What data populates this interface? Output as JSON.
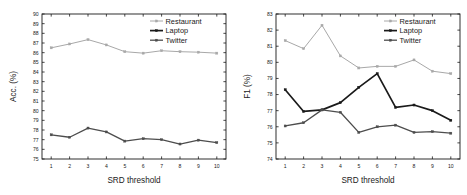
{
  "figure": {
    "background": "#ffffff",
    "panels": [
      "acc-panel",
      "f1-panel"
    ]
  },
  "legend": {
    "position": "top-right",
    "entries": [
      {
        "label": "Restaurant",
        "color": "#a8a8a8",
        "marker": "dash-square",
        "width": 1.0
      },
      {
        "label": "Laptop",
        "color": "#1a1a1a",
        "marker": "dash-square",
        "width": 1.7
      },
      {
        "label": "Twitter",
        "color": "#4d4d4d",
        "marker": "dash-square",
        "width": 1.3
      }
    ]
  },
  "chart_data": [
    {
      "type": "line",
      "name": "accuracy-chart",
      "title": "",
      "xlabel": "SRD threshold",
      "ylabel": "Acc. (%)",
      "x": [
        1,
        2,
        3,
        4,
        5,
        6,
        7,
        8,
        9,
        10
      ],
      "xticklabels": [
        "1",
        "2",
        "3",
        "4",
        "5",
        "6",
        "7",
        "8",
        "9",
        "10"
      ],
      "xlim": [
        0.5,
        10.5
      ],
      "ylim": [
        75,
        90
      ],
      "yticks": [
        75,
        76,
        77,
        78,
        79,
        80,
        81,
        82,
        83,
        84,
        85,
        86,
        87,
        88,
        89,
        90
      ],
      "yticklabels": [
        "75",
        "76",
        "77",
        "78",
        "79",
        "80",
        "81",
        "82",
        "83",
        "84",
        "85",
        "86",
        "87",
        "88",
        "89",
        "90"
      ],
      "grid": false,
      "legend_position": "top-right",
      "series": [
        {
          "name": "Restaurant",
          "color": "#a8a8a8",
          "values": [
            86.5,
            86.9,
            87.35,
            86.8,
            86.1,
            85.95,
            86.2,
            86.1,
            86.05,
            85.95
          ]
        },
        {
          "name": "Laptop",
          "color": "#1a1a1a",
          "values": [
            60.55,
            60.05,
            60.25,
            60.4,
            60.9,
            61.55,
            60.6,
            60.75,
            60.3,
            59.65
          ]
        },
        {
          "name": "Twitter",
          "color": "#4d4d4d",
          "values": [
            77.5,
            77.25,
            78.2,
            77.8,
            76.85,
            77.1,
            77.0,
            76.55,
            76.95,
            76.7
          ]
        }
      ]
    },
    {
      "type": "line",
      "name": "f1-chart",
      "title": "",
      "xlabel": "SRD threshold",
      "ylabel": "F1 (%)",
      "x": [
        1,
        2,
        3,
        4,
        5,
        6,
        7,
        8,
        9,
        10
      ],
      "xticklabels": [
        "1",
        "2",
        "3",
        "4",
        "5",
        "6",
        "7",
        "8",
        "9",
        "10"
      ],
      "xlim": [
        0.5,
        10.5
      ],
      "ylim": [
        74,
        83
      ],
      "yticks": [
        74,
        75,
        76,
        77,
        78,
        79,
        80,
        81,
        82,
        83
      ],
      "yticklabels": [
        "74",
        "75",
        "76",
        "77",
        "78",
        "79",
        "80",
        "81",
        "82",
        "83"
      ],
      "grid": false,
      "legend_position": "top-right",
      "series": [
        {
          "name": "Restaurant",
          "color": "#a8a8a8",
          "values": [
            81.35,
            80.85,
            82.3,
            80.4,
            79.65,
            79.75,
            79.75,
            80.15,
            79.45,
            79.3
          ]
        },
        {
          "name": "Laptop",
          "color": "#1a1a1a",
          "values": [
            78.3,
            76.95,
            77.05,
            77.5,
            78.45,
            79.3,
            77.2,
            77.35,
            77.0,
            76.4
          ]
        },
        {
          "name": "Twitter",
          "color": "#4d4d4d",
          "values": [
            76.05,
            76.25,
            77.05,
            76.9,
            75.65,
            76.0,
            76.1,
            75.65,
            75.7,
            75.6
          ]
        }
      ]
    }
  ]
}
